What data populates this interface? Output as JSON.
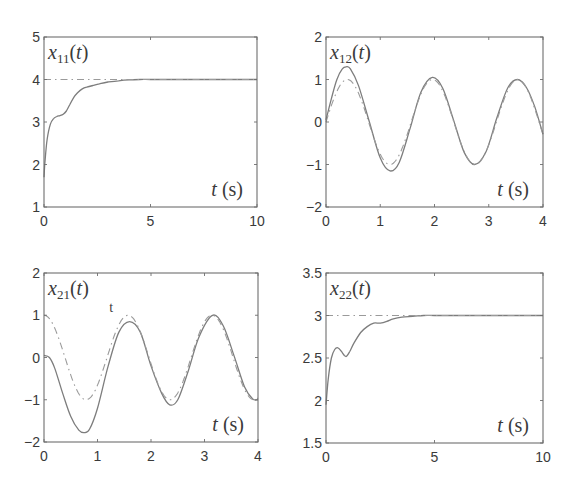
{
  "chart_data": [
    {
      "type": "line",
      "panel": "top-left",
      "title": "x11(t)",
      "title_var": "x",
      "title_sub": "11",
      "title_arg": "(t)",
      "xlabel": "t (s)",
      "xlabel_var": "t",
      "xlabel_unit": "(s)",
      "xlim": [
        0,
        10
      ],
      "ylim": [
        1,
        5
      ],
      "xticks": [
        0,
        5,
        10
      ],
      "yticks": [
        1,
        2,
        3,
        4,
        5
      ],
      "grid": false,
      "series": [
        {
          "name": "response",
          "style": "solid",
          "x": [
            0,
            0.05,
            0.15,
            0.3,
            0.45,
            0.6,
            0.75,
            0.9,
            1.05,
            1.2,
            1.4,
            1.6,
            1.8,
            2.0,
            2.3,
            2.6,
            3.0,
            3.5,
            4.0,
            4.5,
            5.0,
            6,
            7,
            8,
            9,
            10
          ],
          "y": [
            1.7,
            2.1,
            2.6,
            2.95,
            3.08,
            3.13,
            3.15,
            3.18,
            3.26,
            3.4,
            3.58,
            3.7,
            3.78,
            3.82,
            3.86,
            3.9,
            3.94,
            3.97,
            3.99,
            4.0,
            4.0,
            4.0,
            4.0,
            4.0,
            4.0,
            4.0
          ]
        },
        {
          "name": "reference",
          "style": "dash-dot",
          "x": [
            0,
            10
          ],
          "y": [
            4,
            4
          ]
        }
      ]
    },
    {
      "type": "line",
      "panel": "top-right",
      "title": "x12(t)",
      "title_var": "x",
      "title_sub": "12",
      "title_arg": "(t)",
      "xlabel": "t (s)",
      "xlabel_var": "t",
      "xlabel_unit": "(s)",
      "xlim": [
        0,
        4
      ],
      "ylim": [
        -2,
        2
      ],
      "xticks": [
        0,
        1,
        2,
        3,
        4
      ],
      "yticks": [
        -2,
        -1,
        0,
        1,
        2
      ],
      "grid": false,
      "series": [
        {
          "name": "response",
          "style": "solid",
          "x": [
            0,
            0.1,
            0.2,
            0.3,
            0.37,
            0.45,
            0.6,
            0.8,
            1.0,
            1.18,
            1.35,
            1.55,
            1.75,
            1.96,
            2.15,
            2.35,
            2.55,
            2.74,
            2.95,
            3.15,
            3.35,
            3.53,
            3.7,
            3.85,
            4.0
          ],
          "y": [
            0.05,
            0.55,
            1.0,
            1.25,
            1.3,
            1.25,
            0.85,
            0.0,
            -0.85,
            -1.15,
            -0.95,
            -0.15,
            0.7,
            1.05,
            0.8,
            0.05,
            -0.72,
            -1.0,
            -0.7,
            0.1,
            0.8,
            1.0,
            0.8,
            0.35,
            -0.29
          ]
        },
        {
          "name": "reference",
          "style": "dash-dot",
          "function": "sin(4t)"
        }
      ]
    },
    {
      "type": "line",
      "panel": "bottom-left",
      "title": "x21(t)",
      "title_var": "x",
      "title_sub": "21",
      "title_arg": "(t)",
      "xlabel": "t (s)",
      "xlabel_var": "t",
      "xlabel_unit": "(s)",
      "xlim": [
        0,
        4
      ],
      "ylim": [
        -2,
        2
      ],
      "xticks": [
        0,
        1,
        2,
        3,
        4
      ],
      "yticks": [
        -2,
        -1,
        0,
        1,
        2
      ],
      "grid": false,
      "annotation": {
        "text": "t",
        "x": 1.22,
        "y": 1.07
      },
      "series": [
        {
          "name": "response",
          "style": "solid",
          "x": [
            0,
            0.1,
            0.2,
            0.35,
            0.5,
            0.65,
            0.75,
            0.85,
            1.0,
            1.2,
            1.4,
            1.6,
            1.8,
            2.0,
            2.2,
            2.35,
            2.5,
            2.7,
            2.9,
            3.15,
            3.35,
            3.55,
            3.75,
            3.9,
            4.0
          ],
          "y": [
            0.05,
            0.0,
            -0.25,
            -0.85,
            -1.4,
            -1.72,
            -1.78,
            -1.7,
            -1.2,
            -0.2,
            0.6,
            0.85,
            0.6,
            -0.2,
            -0.85,
            -1.12,
            -1.0,
            -0.3,
            0.5,
            1.0,
            0.75,
            0.05,
            -0.7,
            -0.98,
            -1.0
          ]
        },
        {
          "name": "reference",
          "style": "dash-dot",
          "function": "cos(4t)"
        }
      ]
    },
    {
      "type": "line",
      "panel": "bottom-right",
      "title": "x22(t)",
      "title_var": "x",
      "title_sub": "22",
      "title_arg": "(t)",
      "xlabel": "t (s)",
      "xlabel_var": "t",
      "xlabel_unit": "(s)",
      "xlim": [
        0,
        10
      ],
      "ylim": [
        1.5,
        3.5
      ],
      "xticks": [
        0,
        5,
        10
      ],
      "yticks": [
        1.5,
        2,
        2.5,
        3,
        3.5
      ],
      "grid": false,
      "series": [
        {
          "name": "response",
          "style": "solid",
          "x": [
            0,
            0.1,
            0.25,
            0.4,
            0.55,
            0.7,
            0.85,
            0.95,
            1.1,
            1.3,
            1.6,
            1.9,
            2.2,
            2.5,
            2.8,
            3.1,
            3.5,
            4.0,
            4.5,
            5.0,
            6,
            7,
            8,
            9,
            10
          ],
          "y": [
            1.95,
            2.25,
            2.5,
            2.6,
            2.62,
            2.58,
            2.53,
            2.52,
            2.58,
            2.68,
            2.8,
            2.87,
            2.91,
            2.91,
            2.93,
            2.96,
            2.98,
            2.99,
            3.0,
            3.0,
            3.0,
            3.0,
            3.0,
            3.0,
            3.0
          ]
        },
        {
          "name": "reference",
          "style": "dash-dot",
          "x": [
            0,
            10
          ],
          "y": [
            3,
            3
          ]
        }
      ]
    }
  ]
}
